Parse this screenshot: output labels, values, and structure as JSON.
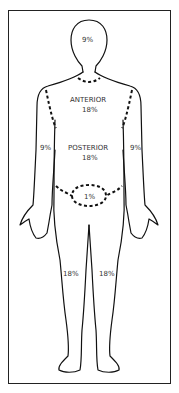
{
  "diagram": {
    "regions": {
      "head": "9%",
      "anterior_trunk": {
        "label": "ANTERIOR",
        "value": "18%"
      },
      "posterior_trunk": {
        "label": "POSTERIOR",
        "value": "18%"
      },
      "left_arm": "9%",
      "right_arm": "9%",
      "perineum": "1%",
      "left_leg": "18%",
      "right_leg": "18%"
    },
    "colors": {
      "line": "#111111",
      "background": "#ffffff"
    }
  }
}
